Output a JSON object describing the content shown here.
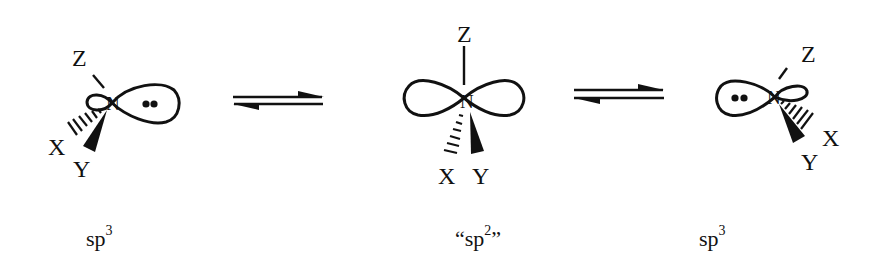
{
  "diagram": {
    "structures": [
      {
        "id": "left",
        "center_atom": "N",
        "substituents": {
          "top": "Z",
          "hashed": "X",
          "wedged": "Y"
        },
        "lone_pair": "••",
        "hybridization_label": "sp",
        "hybridization_superscript": "3"
      },
      {
        "id": "center",
        "center_atom": "N",
        "substituents": {
          "top": "Z",
          "hashed": "X",
          "wedged": "Y"
        },
        "hybridization_label_open_quote": "“",
        "hybridization_label": "sp",
        "hybridization_superscript": "2",
        "hybridization_label_close_quote": "”"
      },
      {
        "id": "right",
        "center_atom": "N",
        "substituents": {
          "top": "Z",
          "hashed": "X",
          "wedged": "Y"
        },
        "lone_pair": "••",
        "hybridization_label": "sp",
        "hybridization_superscript": "3"
      }
    ],
    "equilibria": [
      {
        "id": "eq1",
        "type": "equilibrium-arrows"
      },
      {
        "id": "eq2",
        "type": "equilibrium-arrows"
      }
    ],
    "colors": {
      "ink": "#111111",
      "background": "#ffffff"
    }
  }
}
